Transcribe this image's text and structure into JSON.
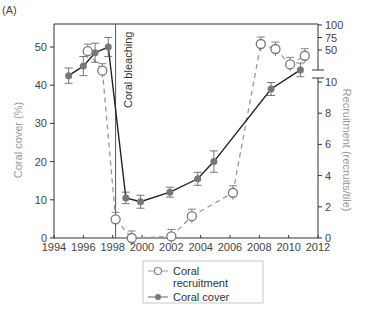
{
  "panel_label": "(A)",
  "chart_data": {
    "type": "line",
    "title": "",
    "xlabel": "",
    "x_ticks": [
      1994,
      1996,
      1998,
      2000,
      2002,
      2004,
      2006,
      2008,
      2010,
      2012
    ],
    "xlim": [
      1994,
      2012
    ],
    "ylabel_left": "Coral cover (%)",
    "y_left_ticks": [
      0,
      10,
      20,
      30,
      40,
      50
    ],
    "ylim_left": [
      0,
      55
    ],
    "ylabel_right": "Recruitment (recruits/tile)",
    "y_right_ticks_lower": [
      0,
      2,
      4,
      6,
      8,
      10
    ],
    "y_right_ticks_upper": [
      50,
      75,
      100
    ],
    "right_axis_broken": true,
    "grid": false,
    "legend_position": "below plot, center",
    "annotations": [
      {
        "text": "Coral bleaching",
        "x": 1998.2,
        "orientation": "vertical",
        "line": "solid vertical line"
      }
    ],
    "series": [
      {
        "name": "Coral recruitment",
        "marker": "open circle",
        "line": "dashed grey",
        "axis": "right",
        "x": [
          1996.3,
          1997.3,
          1998.2,
          1999.3,
          2002.0,
          2003.4,
          2006.2,
          2008.1,
          2009.1,
          2010.1,
          2011.1
        ],
        "values": [
          48,
          14,
          1.2,
          0,
          0.1,
          1.4,
          2.9,
          62,
          52,
          25,
          40
        ]
      },
      {
        "name": "Coral cover",
        "marker": "filled circle",
        "line": "solid black",
        "axis": "left",
        "x": [
          1995.0,
          1996.0,
          1996.8,
          1997.7,
          1998.9,
          1999.9,
          2001.9,
          2003.8,
          2004.9,
          2008.8,
          2010.8
        ],
        "values": [
          42.5,
          45,
          48.5,
          50,
          10.5,
          9.5,
          12,
          15.5,
          20,
          39,
          44
        ],
        "error": [
          2,
          2.5,
          2.5,
          2.5,
          1.5,
          1.7,
          1.3,
          1.7,
          2.8,
          1.7,
          1.8
        ]
      }
    ]
  },
  "legend": {
    "items": [
      {
        "label_line1": "Coral",
        "label_line2": "recruitment"
      },
      {
        "label_line1": "Coral cover",
        "label_line2": ""
      }
    ]
  },
  "colors": {
    "axis": "#333333",
    "cover_line": "#222222",
    "cover_marker": "#777777",
    "recruit_line": "#999999",
    "axis_title": "#999999"
  }
}
